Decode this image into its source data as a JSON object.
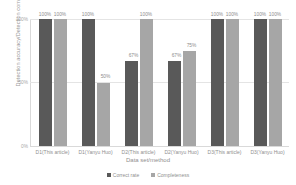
{
  "chart_data": {
    "type": "bar",
    "title": "",
    "xlabel": "Data set/method",
    "ylabel": "Detection accuracy/Detection completeness",
    "categories": [
      "D1(This article)",
      "D1(Yanyu Huo)",
      "D2(This article)",
      "D2(Yanyu Huo)",
      "D3(This article)",
      "D3(Yanyu Huo)"
    ],
    "series": [
      {
        "name": "Correct rate",
        "color": "#595959",
        "values": [
          100,
          100,
          67,
          67,
          100,
          100
        ]
      },
      {
        "name": "Completeness",
        "color": "#a6a6a6",
        "values": [
          100,
          50,
          100,
          75,
          100,
          100
        ]
      }
    ],
    "data_labels": [
      [
        "100%",
        "100%"
      ],
      [
        "100%",
        "50%"
      ],
      [
        "67%",
        "100%"
      ],
      [
        "67%",
        "75%"
      ],
      [
        "100%",
        "100%"
      ],
      [
        "100%",
        "100%"
      ]
    ],
    "ylim": [
      0,
      100
    ],
    "yticks": [
      "100%",
      "50%",
      "0%"
    ],
    "grid": true,
    "legend_position": "bottom"
  }
}
